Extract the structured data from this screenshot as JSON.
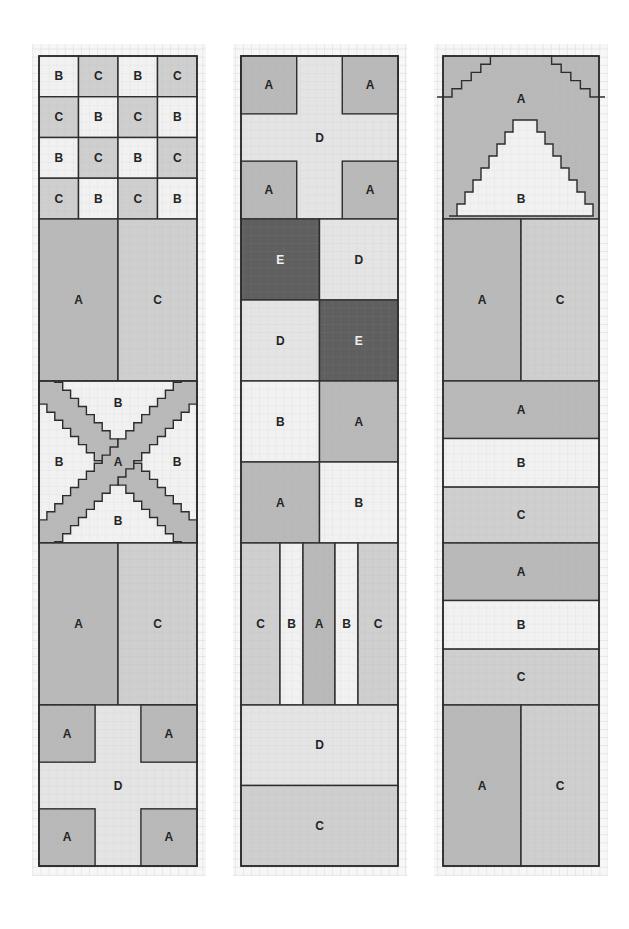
{
  "colors": {
    "A": "#b9b9b9",
    "B": "#f1f1f1",
    "C": "#cfcfcf",
    "D": "#e4e4e4",
    "E": "#5f5f5f",
    "outline": "#2b2b2b",
    "grid": "#c8c8c8",
    "paper": "#f7f7f7"
  },
  "fabric_keys": [
    "A",
    "B",
    "C",
    "D",
    "E"
  ],
  "strips": [
    {
      "id": "strip-1",
      "blocks": [
        {
          "type": "checkerboard",
          "rows": [
            [
              "B",
              "C",
              "B",
              "C"
            ],
            [
              "C",
              "B",
              "C",
              "B"
            ],
            [
              "B",
              "C",
              "B",
              "C"
            ],
            [
              "C",
              "B",
              "C",
              "B"
            ]
          ]
        },
        {
          "type": "halves-vertical",
          "left": "A",
          "right": "C"
        },
        {
          "type": "x-cross",
          "cross": "A",
          "background": "B",
          "labels": [
            "B",
            "B",
            "A",
            "B",
            "B"
          ]
        },
        {
          "type": "halves-vertical",
          "left": "A",
          "right": "C"
        },
        {
          "type": "corner-squares",
          "corners": "A",
          "cross": "D",
          "labels": [
            "A",
            "A",
            "D",
            "A",
            "A"
          ]
        }
      ]
    },
    {
      "id": "strip-2",
      "blocks": [
        {
          "type": "corner-squares",
          "corners": "A",
          "cross": "D",
          "labels": [
            "A",
            "A",
            "D",
            "A",
            "A"
          ]
        },
        {
          "type": "four-patch",
          "cells": [
            [
              "E",
              "D"
            ],
            [
              "D",
              "E"
            ]
          ]
        },
        {
          "type": "four-patch",
          "cells": [
            [
              "B",
              "A"
            ],
            [
              "A",
              "B"
            ]
          ]
        },
        {
          "type": "vertical-stripes",
          "stripes": [
            "C",
            "B",
            "A",
            "B",
            "C"
          ]
        },
        {
          "type": "horizontal-bars",
          "bars": [
            "D",
            "C"
          ]
        }
      ]
    },
    {
      "id": "strip-3",
      "blocks": [
        {
          "type": "stepped-triangle",
          "outer": "A",
          "inner": "B",
          "labels": [
            "A",
            "B"
          ]
        },
        {
          "type": "halves-vertical",
          "left": "A",
          "right": "C"
        },
        {
          "type": "horizontal-bars",
          "bars": [
            "A",
            "B",
            "C"
          ]
        },
        {
          "type": "horizontal-bars",
          "bars": [
            "A",
            "B",
            "C"
          ]
        },
        {
          "type": "halves-vertical",
          "left": "A",
          "right": "C"
        }
      ]
    }
  ]
}
